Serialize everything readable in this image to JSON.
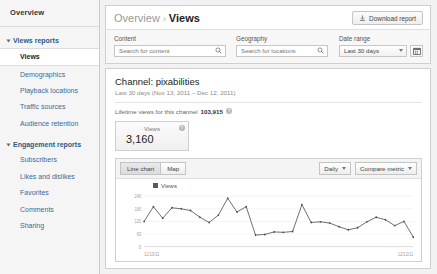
{
  "sidebar": {
    "overview_label": "Overview",
    "sections": [
      {
        "title": "Views reports",
        "items": [
          {
            "label": "Views",
            "active": true
          },
          {
            "label": "Demographics",
            "active": false
          },
          {
            "label": "Playback locations",
            "active": false
          },
          {
            "label": "Traffic sources",
            "active": false
          },
          {
            "label": "Audience retention",
            "active": false
          }
        ]
      },
      {
        "title": "Engagement reports",
        "items": [
          {
            "label": "Subscribers",
            "active": false
          },
          {
            "label": "Likes and dislikes",
            "active": false
          },
          {
            "label": "Favorites",
            "active": false
          },
          {
            "label": "Comments",
            "active": false
          },
          {
            "label": "Sharing",
            "active": false
          }
        ]
      }
    ]
  },
  "header": {
    "breadcrumb_parent": "Overview",
    "breadcrumb_sep": "›",
    "breadcrumb_current": "Views",
    "download_label": "Download report",
    "download_icon": "download-icon"
  },
  "filters": {
    "content": {
      "label": "Content",
      "placeholder": "Search for content",
      "value": "",
      "icon": "search-icon"
    },
    "geography": {
      "label": "Geography",
      "placeholder": "Search for locations",
      "value": "",
      "icon": "search-icon"
    },
    "date_range": {
      "label": "Date range",
      "selected": "Last 30 days",
      "options": [
        "Last 30 days"
      ],
      "calendar_icon": "calendar-icon",
      "caret_icon": "chevron-down-icon"
    }
  },
  "report": {
    "title": "Channel: pixabilities",
    "subtitle": "Last 30 days (Nov 13, 2011 – Dec 12, 2011)",
    "lifetime_label": "Lifetime views for this channel",
    "lifetime_value": "103,915",
    "info_icon": "info-icon",
    "metric_card": {
      "label": "Views",
      "value": "3,160",
      "info_icon": "info-icon"
    }
  },
  "chart_toolbar": {
    "view_modes": [
      {
        "label": "Line chart",
        "selected": true
      },
      {
        "label": "Map",
        "selected": false
      }
    ],
    "granularity": {
      "selected": "Daily",
      "caret_icon": "chevron-down-icon"
    },
    "compare": {
      "label": "Compare metric",
      "caret_icon": "chevron-down-icon"
    }
  },
  "chart_data": {
    "type": "line",
    "title": "",
    "xlabel": "",
    "ylabel": "",
    "legend": [
      "Views"
    ],
    "legend_position": "top-left",
    "grid": true,
    "line_color": "#4a4a4a",
    "ylim": [
      0,
      240
    ],
    "yticks": [
      0,
      60,
      120,
      180,
      240
    ],
    "ytick_labels": [
      "0",
      "60",
      "120",
      "180",
      "240"
    ],
    "xtick_labels": [
      "11/13/11",
      "12/12/11"
    ],
    "x": [
      "11/13/11",
      "11/14/11",
      "11/15/11",
      "11/16/11",
      "11/17/11",
      "11/18/11",
      "11/19/11",
      "11/20/11",
      "11/21/11",
      "11/22/11",
      "11/23/11",
      "11/24/11",
      "11/25/11",
      "11/26/11",
      "11/27/11",
      "11/28/11",
      "11/29/11",
      "11/30/11",
      "12/01/11",
      "12/02/11",
      "12/03/11",
      "12/04/11",
      "12/05/11",
      "12/06/11",
      "12/07/11",
      "12/08/11",
      "12/09/11",
      "12/10/11",
      "12/11/11",
      "12/12/11"
    ],
    "series": [
      {
        "name": "Views",
        "values": [
          120,
          190,
          135,
          185,
          180,
          172,
          140,
          115,
          150,
          230,
          165,
          190,
          55,
          58,
          70,
          68,
          72,
          200,
          115,
          118,
          112,
          95,
          80,
          90,
          118,
          140,
          128,
          100,
          120,
          45
        ]
      }
    ]
  }
}
